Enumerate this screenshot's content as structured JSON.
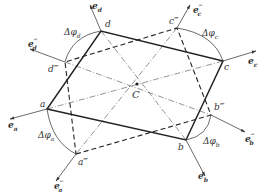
{
  "diagram": {
    "colors": {
      "line": "#333333",
      "thin": "#555555",
      "background": "#ffffff"
    },
    "points": {
      "C": {
        "label": "C",
        "x": 137,
        "y": 84
      },
      "a": {
        "label": "a",
        "x": 47,
        "y": 109
      },
      "b": {
        "label": "b",
        "x": 186,
        "y": 140
      },
      "c": {
        "label": "c",
        "x": 223,
        "y": 61
      },
      "d": {
        "label": "d",
        "x": 101,
        "y": 31
      },
      "a3": {
        "label": "a‴",
        "x": 76,
        "y": 154
      },
      "b3": {
        "label": "b‴",
        "x": 211,
        "y": 115
      },
      "c3": {
        "label": "c‴",
        "x": 177,
        "y": 28
      },
      "d3": {
        "label": "d‴",
        "x": 65,
        "y": 62
      }
    },
    "labels": {
      "a": "a",
      "b": "b",
      "c": "c",
      "d": "d",
      "C": "C",
      "a3": "a‴",
      "b3": "b‴",
      "c3": "c‴",
      "d3": "d‴",
      "e_a": "e",
      "e_a_sub": "a",
      "e_b": "e",
      "e_b_sub": "b",
      "e_c": "e",
      "e_c_sub": "c",
      "e_d": "e",
      "e_d_sub": "d",
      "e_a3": "e",
      "e_a3_sub": "a",
      "e_a3_sup": "‴",
      "e_b3": "e",
      "e_b3_sub": "b",
      "e_b3_sup": "‴",
      "e_c3": "e",
      "e_c3_sub": "c",
      "e_c3_sup": "‴",
      "e_d3": "e",
      "e_d3_sub": "d",
      "e_d3_sup": "‴",
      "dphi_a": "Δφ",
      "dphi_a_sub": "a",
      "dphi_b": "Δφ",
      "dphi_b_sub": "b",
      "dphi_c": "Δφ",
      "dphi_c_sub": "c",
      "dphi_d": "Δφ",
      "dphi_d_sub": "d"
    }
  }
}
